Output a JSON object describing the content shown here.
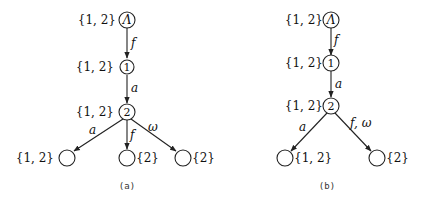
{
  "figures": [
    {
      "id": "a",
      "caption": "(a)",
      "nodes": [
        {
          "key": "root",
          "inner": "Λ",
          "set": "{1, 2}"
        },
        {
          "key": "n1",
          "inner": "1",
          "set": "{1, 2}"
        },
        {
          "key": "n2",
          "inner": "2",
          "set": "{1, 2}"
        },
        {
          "key": "leaf_left",
          "inner": "",
          "set": "{1, 2}"
        },
        {
          "key": "leaf_mid",
          "inner": "",
          "set": "{2}"
        },
        {
          "key": "leaf_right",
          "inner": "",
          "set": "{2}"
        }
      ],
      "edges": [
        {
          "from": "root",
          "to": "n1",
          "label": "f"
        },
        {
          "from": "n1",
          "to": "n2",
          "label": "a"
        },
        {
          "from": "n2",
          "to": "leaf_left",
          "label": "a"
        },
        {
          "from": "n2",
          "to": "leaf_mid",
          "label": "f"
        },
        {
          "from": "n2",
          "to": "leaf_right",
          "label": "ω"
        }
      ]
    },
    {
      "id": "b",
      "caption": "(b)",
      "nodes": [
        {
          "key": "root",
          "inner": "Λ",
          "set": "{1, 2}"
        },
        {
          "key": "n1",
          "inner": "1",
          "set": "{1, 2}"
        },
        {
          "key": "n2",
          "inner": "2",
          "set": "{1, 2}"
        },
        {
          "key": "leaf_left",
          "inner": "",
          "set": "{1, 2}"
        },
        {
          "key": "leaf_right",
          "inner": "",
          "set": "{2}"
        }
      ],
      "edges": [
        {
          "from": "root",
          "to": "n1",
          "label": "f"
        },
        {
          "from": "n1",
          "to": "n2",
          "label": "a"
        },
        {
          "from": "n2",
          "to": "leaf_left",
          "label": "a"
        },
        {
          "from": "n2",
          "to": "leaf_right",
          "label": "f, ω"
        }
      ]
    }
  ]
}
